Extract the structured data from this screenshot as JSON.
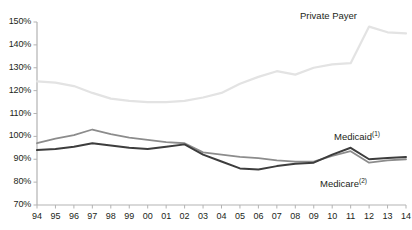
{
  "chart_data": {
    "type": "line",
    "title": "",
    "subtitle": "",
    "xlabel": "",
    "ylabel": "",
    "grid": false,
    "legend_position": "inline-annotations",
    "x": [
      "94",
      "95",
      "96",
      "97",
      "98",
      "99",
      "00",
      "01",
      "02",
      "03",
      "04",
      "05",
      "06",
      "07",
      "08",
      "09",
      "10",
      "11",
      "12",
      "13",
      "14"
    ],
    "xtick_labels": [
      "94",
      "95",
      "96",
      "97",
      "98",
      "99",
      "00",
      "01",
      "02",
      "03",
      "04",
      "05",
      "06",
      "07",
      "08",
      "09",
      "10",
      "11",
      "12",
      "13",
      "14"
    ],
    "ytick_labels": [
      "70%",
      "80%",
      "90%",
      "100%",
      "110%",
      "120%",
      "130%",
      "140%",
      "150%"
    ],
    "ytick_values": [
      70,
      80,
      90,
      100,
      110,
      120,
      130,
      140,
      150
    ],
    "ylim": [
      70,
      150
    ],
    "yunit": "%",
    "series": [
      {
        "name": "Private Payer",
        "label": "Private Payer",
        "label_sup": "",
        "color": "#e3e3e3",
        "width": 2.2,
        "values": [
          124,
          123.5,
          122,
          119,
          116.5,
          115.5,
          115,
          115,
          115.5,
          117,
          119,
          123,
          126,
          128.5,
          127,
          130,
          131.5,
          132,
          148,
          145.5,
          145
        ]
      },
      {
        "name": "Medicaid",
        "label": "Medicaid",
        "label_sup": "(1)",
        "color": "#8c8c8c",
        "width": 1.8,
        "values": [
          97,
          99,
          100.5,
          103,
          101,
          99.5,
          98.5,
          97.5,
          97,
          93,
          92,
          91,
          90.5,
          89.5,
          89,
          89,
          91.5,
          93.5,
          88.5,
          89.5,
          90
        ]
      },
      {
        "name": "Medicare",
        "label": "Medicare",
        "label_sup": "(2)",
        "color": "#3d3d3d",
        "width": 2.0,
        "values": [
          94,
          94.5,
          95.5,
          97,
          96,
          95,
          94.5,
          95.5,
          96.5,
          92,
          89,
          86,
          85.5,
          87,
          88,
          88.5,
          92,
          95,
          90,
          90.5,
          91
        ]
      }
    ],
    "annotations": [
      {
        "name": "private-payer-label",
        "text": "Private Payer",
        "sup": "",
        "x_px": 300,
        "y_px": 10
      },
      {
        "name": "medicaid-label",
        "text": "Medicaid",
        "sup": "(1)",
        "x_px": 334,
        "y_px": 131
      },
      {
        "name": "medicare-label",
        "text": "Medicare",
        "sup": "(2)",
        "x_px": 320,
        "y_px": 178
      }
    ],
    "axis": {
      "color": "#b3b3b3",
      "plot_left_px": 37,
      "plot_right_px": 406,
      "plot_top_px": 22,
      "plot_bottom_px": 205
    }
  }
}
